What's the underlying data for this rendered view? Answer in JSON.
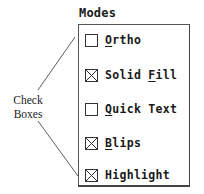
{
  "group": {
    "title": "Modes",
    "items": [
      {
        "label": "Ortho",
        "mnemonic_index": 0,
        "checked": false
      },
      {
        "label": "Solid Fill",
        "mnemonic_index": 6,
        "checked": true
      },
      {
        "label": "Quick Text",
        "mnemonic_index": 0,
        "checked": false
      },
      {
        "label": "Blips",
        "mnemonic_index": 0,
        "checked": true
      },
      {
        "label": "Highlight",
        "mnemonic_index": -1,
        "checked": true
      }
    ]
  },
  "annotation": {
    "line1": "Check",
    "line2": "Boxes"
  },
  "colors": {
    "border": "#444444",
    "text": "#1a1a1a",
    "background": "#ffffff"
  }
}
